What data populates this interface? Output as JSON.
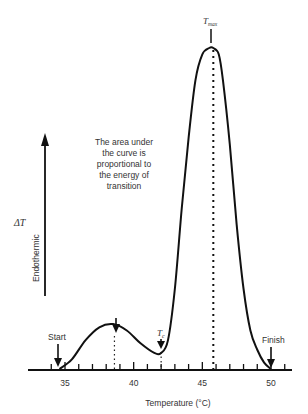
{
  "figure": {
    "y_axis": {
      "symbol": "ΔT",
      "direction_label": "Endothermic"
    },
    "x_axis": {
      "label": "Temperature (°C)",
      "tick_labels": [
        "35",
        "40",
        "45",
        "50"
      ],
      "minor_tick_step": 1
    },
    "annotation": {
      "lines": [
        "The area under",
        "the curve is",
        "proportional to",
        "the energy of",
        "transition"
      ]
    },
    "markers": {
      "start": "Start",
      "finish": "Finish",
      "tc_main": "T",
      "tc_sub": "c",
      "tmax_main": "T",
      "tmax_sub": "max"
    }
  },
  "chart_data": {
    "type": "line",
    "title": "",
    "xlabel": "Temperature (°C)",
    "ylabel": "ΔT (Endothermic)",
    "xlim": [
      33.5,
      51.5
    ],
    "x_ticks": [
      35,
      40,
      45,
      50
    ],
    "series": [
      {
        "name": "DSC thermogram",
        "x": [
          34.6,
          35.5,
          36.5,
          37.5,
          38.5,
          39.5,
          40.5,
          41.5,
          42.0,
          42.5,
          43.0,
          43.5,
          44.0,
          44.5,
          45.0,
          45.5,
          45.8,
          46.2,
          46.5,
          47.0,
          47.5,
          48.0,
          48.5,
          49.0,
          49.5,
          50.0
        ],
        "y": [
          0.0,
          0.03,
          0.09,
          0.13,
          0.14,
          0.12,
          0.08,
          0.05,
          0.05,
          0.09,
          0.25,
          0.5,
          0.72,
          0.9,
          0.98,
          1.0,
          1.0,
          0.98,
          0.9,
          0.7,
          0.45,
          0.25,
          0.12,
          0.06,
          0.02,
          0.0
        ]
      }
    ],
    "annotations": [
      {
        "text": "Start",
        "x": 34.6
      },
      {
        "text": "Pre-transition peak",
        "x": 38.6
      },
      {
        "text": "Tc",
        "x": 42.0
      },
      {
        "text": "Tmax",
        "x": 45.8
      },
      {
        "text": "Finish",
        "x": 50.0
      }
    ]
  }
}
